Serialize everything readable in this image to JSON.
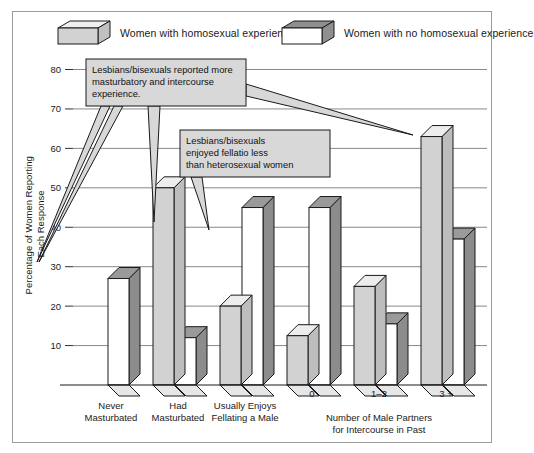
{
  "figure": {
    "border_color": "#9b9b9b",
    "background": "#ffffff"
  },
  "legend": {
    "position": "top",
    "items": [
      {
        "label": "Women with homosexual experience",
        "icon": "legend-box-light",
        "front_color": "#d2d2d2",
        "top_color": "#efefef",
        "side_color": "#c0c0c0"
      },
      {
        "label": "Women with no homosexual experience",
        "icon": "legend-box-dark",
        "front_color": "#ffffff",
        "top_color": "#8f8f8f",
        "side_color": "#8f8f8f"
      }
    ]
  },
  "callouts": [
    {
      "id": "callout-masturbation",
      "lines": [
        "Lesbians/bisexuals reported more",
        "masturbatory and intercourse",
        "experience."
      ],
      "fill": "#d8d8d8"
    },
    {
      "id": "callout-fellatio",
      "lines": [
        "Lesbians/bisexuals",
        "enjoyed fellatio less",
        "than heterosexual women"
      ],
      "fill": "#d8d8d8"
    }
  ],
  "chart_data": {
    "type": "bar",
    "title": "",
    "xlabel": "",
    "ylabel": "Percentage of Women Reporting Each Response",
    "ylim": [
      0,
      80
    ],
    "yticks": [
      10,
      20,
      30,
      40,
      50,
      60,
      70,
      80
    ],
    "grid": true,
    "legend_position": "top",
    "categories": [
      "Never Masturbated",
      "Had Masturbated",
      "Usually Enjoys Fellating a Male",
      "0",
      "1–2",
      "3 +"
    ],
    "category_labels": [
      {
        "lines": [
          "Never",
          "Masturbated"
        ]
      },
      {
        "lines": [
          "Had",
          "Masturbated"
        ]
      },
      {
        "lines": [
          "Usually Enjoys",
          "Fellating a Male"
        ]
      },
      {
        "lines": [
          "0"
        ]
      },
      {
        "lines": [
          "1–2"
        ]
      },
      {
        "lines": [
          "3 +"
        ]
      }
    ],
    "group_label": {
      "lines": [
        "Number of Male Partners",
        "for Intercourse in Past"
      ],
      "covers": [
        "0",
        "1–2",
        "3 +"
      ]
    },
    "series": [
      {
        "name": "Women with homosexual experience",
        "values": [
          null,
          50,
          20,
          12.5,
          25,
          63
        ]
      },
      {
        "name": "Women with no homosexual experience",
        "values": [
          27,
          12,
          45,
          45,
          15.5,
          37
        ]
      }
    ]
  }
}
